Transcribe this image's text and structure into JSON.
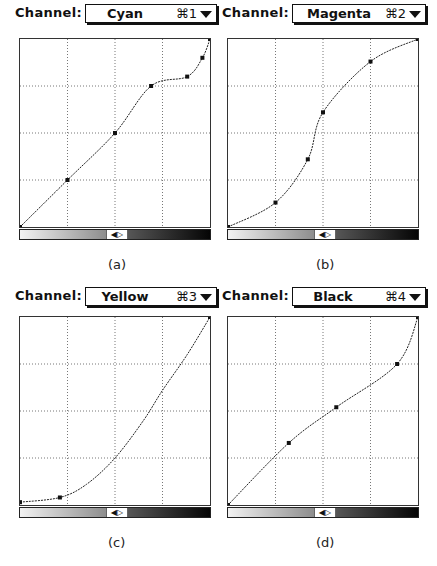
{
  "panels": [
    {
      "id": "a",
      "channel_label": "Channel:",
      "channel": "Cyan",
      "shortcut": "⌘1",
      "caption": "(a)"
    },
    {
      "id": "b",
      "channel_label": "Channel:",
      "channel": "Magenta",
      "shortcut": "⌘2",
      "caption": "(b)"
    },
    {
      "id": "c",
      "channel_label": "Channel:",
      "channel": "Yellow",
      "shortcut": "⌘3",
      "caption": "(c)"
    },
    {
      "id": "d",
      "channel_label": "Channel:",
      "channel": "Black",
      "shortcut": "⌘4",
      "caption": "(d)"
    }
  ],
  "scroller_glyph": "◀▷",
  "chart_data": [
    {
      "type": "line",
      "title": "Cyan",
      "xlim": [
        0,
        1
      ],
      "ylim": [
        0,
        1
      ],
      "grid": "4x4 dotted",
      "control_points": [
        [
          0,
          0
        ],
        [
          0.25,
          0.25
        ],
        [
          0.5,
          0.5
        ],
        [
          0.69,
          0.75
        ],
        [
          0.88,
          0.8
        ],
        [
          0.96,
          0.9
        ],
        [
          1,
          1
        ]
      ]
    },
    {
      "type": "line",
      "title": "Magenta",
      "xlim": [
        0,
        1
      ],
      "ylim": [
        0,
        1
      ],
      "grid": "4x4 dotted",
      "control_points": [
        [
          0,
          0
        ],
        [
          0.25,
          0.13
        ],
        [
          0.42,
          0.36
        ],
        [
          0.5,
          0.61
        ],
        [
          0.75,
          0.88
        ],
        [
          1,
          1
        ]
      ]
    },
    {
      "type": "line",
      "title": "Yellow",
      "xlim": [
        0,
        1
      ],
      "ylim": [
        0,
        1
      ],
      "grid": "4x4 dotted",
      "control_points": [
        [
          0,
          0.015
        ],
        [
          0.21,
          0.04
        ],
        [
          1,
          1
        ]
      ],
      "curve_samples": [
        [
          0,
          0.015
        ],
        [
          0.21,
          0.04
        ],
        [
          0.35,
          0.11
        ],
        [
          0.5,
          0.25
        ],
        [
          0.65,
          0.45
        ],
        [
          0.75,
          0.61
        ],
        [
          0.88,
          0.8
        ],
        [
          1,
          1
        ]
      ]
    },
    {
      "type": "line",
      "title": "Black",
      "xlim": [
        0,
        1
      ],
      "ylim": [
        0,
        1
      ],
      "grid": "4x4 dotted",
      "control_points": [
        [
          0,
          0
        ],
        [
          0.32,
          0.33
        ],
        [
          0.57,
          0.52
        ],
        [
          0.89,
          0.75
        ],
        [
          1,
          1
        ]
      ]
    }
  ]
}
